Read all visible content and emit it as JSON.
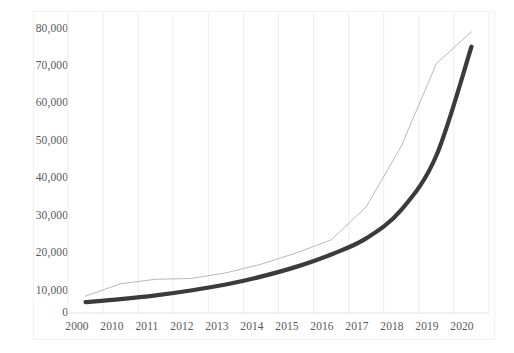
{
  "chart_data": {
    "type": "line",
    "title": "",
    "subtitle": "",
    "xlabel": "",
    "ylabel": "",
    "xlim": [
      0,
      12
    ],
    "ylim": [
      0,
      80000
    ],
    "grid": "vertical-only",
    "legend": "none",
    "categories": [
      "2000",
      "2010",
      "2011",
      "2012",
      "2013",
      "2014",
      "2015",
      "2016",
      "2017",
      "2018",
      "2019",
      "2020"
    ],
    "y_ticks": [
      "0",
      "10,000",
      "20,000",
      "30,000",
      "40,000",
      "50,000",
      "60,000",
      "70,000",
      "80,000"
    ],
    "y_tick_values": [
      0,
      10000,
      20000,
      30000,
      40000,
      50000,
      60000,
      70000,
      80000
    ],
    "series": [
      {
        "name": "data-series",
        "style": "thin-line",
        "color": "#a6a6a6",
        "width": 0.8,
        "values": [
          4500,
          7800,
          9000,
          9200,
          10700,
          13000,
          16000,
          19500,
          28300,
          44500,
          66500,
          75000
        ]
      },
      {
        "name": "trendline-exponential",
        "style": "thick-smooth-curve",
        "color": "#3b3b3b",
        "width": 4.2,
        "values": [
          2900,
          3700,
          4700,
          6000,
          7600,
          9700,
          12300,
          15600,
          19900,
          27500,
          42000,
          71000
        ]
      }
    ],
    "annotations": []
  },
  "axes": {
    "y_axis_name": "value-axis",
    "x_axis_name": "category-axis"
  }
}
